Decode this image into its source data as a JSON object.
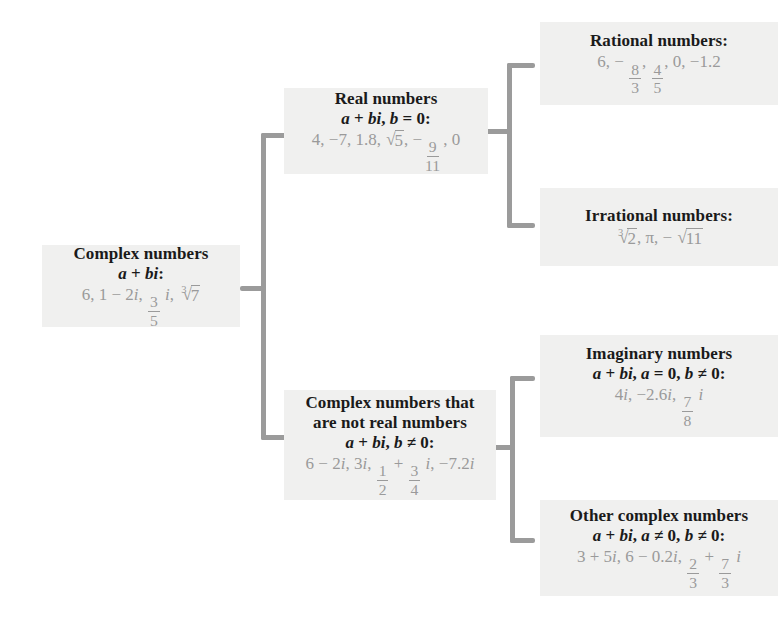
{
  "diagram": {
    "box_fill": "#f0f0ef",
    "connector_color": "#9b9b9b",
    "example_text_color": "#9a9a9a",
    "nodes": {
      "complex": {
        "title": "Complex numbers",
        "form": "a + bi:",
        "examples": "6, 1 − 2i, 3/5 i, ∛7"
      },
      "real": {
        "title": "Real numbers",
        "form": "a + bi, b = 0:",
        "examples": "4, −7, 1.8, √5, −9/11, 0"
      },
      "rational": {
        "title": "Rational numbers:",
        "examples": "6, −8/3, 4/5, 0, −1.2"
      },
      "irrational": {
        "title": "Irrational numbers:",
        "examples": "∛2, π, −√11"
      },
      "not_real": {
        "title_line1": "Complex numbers that",
        "title_line2": "are not real numbers",
        "form": "a + bi, b ≠ 0:",
        "examples": "6 − 2i, 3i, 1/2 + 3/4 i, −7.2i"
      },
      "imaginary": {
        "title": "Imaginary numbers",
        "form": "a + bi, a = 0, b ≠ 0:",
        "examples": "4i, −2.6i, 7/8 i"
      },
      "other_complex": {
        "title": "Other complex numbers",
        "form": "a + bi, a ≠ 0, b ≠ 0:",
        "examples": "3 + 5i, 6 − 0.2i, 2/3 + 7/3 i"
      }
    },
    "symbols": {
      "plus": "+",
      "minus": "−",
      "equals": "=",
      "not_equals": "≠",
      "comma": ",",
      "colon": ":",
      "zero": "0",
      "pi": "π",
      "radical": "√",
      "var_a": "a",
      "var_b": "b",
      "var_i": "i"
    }
  }
}
